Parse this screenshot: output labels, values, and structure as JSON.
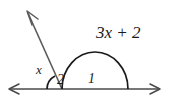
{
  "figure": {
    "kind": "geometry-angle-diagram",
    "background_color": "#ffffff",
    "stroke_color": "#3a3a3a",
    "arc_color": "#1a1a1a",
    "text_color": "#1a1a1a",
    "labels": {
      "large_angle": "3x + 2",
      "small_angle_variable": "x",
      "angle_number_left": "2",
      "angle_number_right": "1"
    },
    "elements": {
      "baseline_name": "horizontal-line",
      "ray_name": "upper-left-ray",
      "large_arc_name": "large-angle-arc",
      "small_arc_name": "small-angle-arc"
    }
  }
}
